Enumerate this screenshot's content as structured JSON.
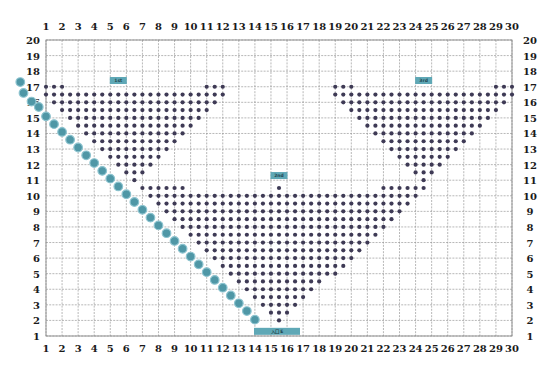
{
  "chart_data": {
    "type": "scatter",
    "title": "",
    "xlabel": "",
    "ylabel": "",
    "x_ticks": [
      1,
      2,
      3,
      4,
      5,
      6,
      7,
      8,
      9,
      10,
      11,
      12,
      13,
      14,
      15,
      16,
      17,
      18,
      19,
      20,
      21,
      22,
      23,
      24,
      25,
      26,
      27,
      28,
      29,
      30
    ],
    "y_ticks": [
      1,
      2,
      3,
      4,
      5,
      6,
      7,
      8,
      9,
      10,
      11,
      12,
      13,
      14,
      15,
      16,
      17,
      18,
      19,
      20
    ],
    "xlim": [
      1,
      30
    ],
    "ylim": [
      1,
      20
    ],
    "grid": true,
    "colors": {
      "dot": "#3e3a55",
      "seat": "#4f97a6",
      "label_box": "#5fa8b6"
    },
    "dot_step": 0.5,
    "regions": [
      {
        "name": "left-triangle",
        "rows": [
          {
            "row": 17,
            "spans": [
              [
                1,
                2
              ],
              [
                11,
                12
              ]
            ]
          },
          {
            "row": 16.5,
            "spans": [
              [
                1,
                12
              ]
            ]
          },
          {
            "row": 16,
            "spans": [
              [
                1.5,
                11.5
              ]
            ]
          },
          {
            "row": 15.5,
            "spans": [
              [
                2,
                11
              ]
            ]
          },
          {
            "row": 15,
            "spans": [
              [
                2.5,
                10.5
              ]
            ]
          },
          {
            "row": 14.5,
            "spans": [
              [
                3,
                10
              ]
            ]
          },
          {
            "row": 14,
            "spans": [
              [
                3.5,
                9.5
              ]
            ]
          },
          {
            "row": 13.5,
            "spans": [
              [
                4,
                9
              ]
            ]
          },
          {
            "row": 13,
            "spans": [
              [
                4.5,
                8.5
              ]
            ]
          },
          {
            "row": 12.5,
            "spans": [
              [
                5,
                8
              ]
            ]
          },
          {
            "row": 12,
            "spans": [
              [
                5.5,
                7.5
              ]
            ]
          },
          {
            "row": 11.5,
            "spans": [
              [
                6,
                7
              ]
            ]
          },
          {
            "row": 11,
            "spans": [
              [
                6.5,
                6.5
              ]
            ]
          }
        ]
      },
      {
        "name": "right-triangle",
        "rows": [
          {
            "row": 17,
            "spans": [
              [
                19,
                20
              ],
              [
                29,
                30
              ]
            ]
          },
          {
            "row": 16.5,
            "spans": [
              [
                19,
                30
              ]
            ]
          },
          {
            "row": 16,
            "spans": [
              [
                19.5,
                29.5
              ]
            ]
          },
          {
            "row": 15.5,
            "spans": [
              [
                20,
                29
              ]
            ]
          },
          {
            "row": 15,
            "spans": [
              [
                20.5,
                28.5
              ]
            ]
          },
          {
            "row": 14.5,
            "spans": [
              [
                21,
                28
              ]
            ]
          },
          {
            "row": 14,
            "spans": [
              [
                21.5,
                27.5
              ]
            ]
          },
          {
            "row": 13.5,
            "spans": [
              [
                22,
                27
              ]
            ]
          },
          {
            "row": 13,
            "spans": [
              [
                22.5,
                26.5
              ]
            ]
          },
          {
            "row": 12.5,
            "spans": [
              [
                23,
                26
              ]
            ]
          },
          {
            "row": 12,
            "spans": [
              [
                23.5,
                25.5
              ]
            ]
          },
          {
            "row": 11.5,
            "spans": [
              [
                24,
                25
              ]
            ]
          },
          {
            "row": 11,
            "spans": [
              [
                24.5,
                24.5
              ]
            ]
          }
        ]
      },
      {
        "name": "center-triangle",
        "rows": [
          {
            "row": 10.5,
            "spans": [
              [
                7,
                9.5
              ],
              [
                15.5,
                15.5
              ],
              [
                22,
                24.5
              ]
            ]
          },
          {
            "row": 10,
            "spans": [
              [
                7.5,
                24
              ]
            ]
          },
          {
            "row": 9.5,
            "spans": [
              [
                8,
                23.5
              ]
            ]
          },
          {
            "row": 9,
            "spans": [
              [
                8.5,
                23
              ]
            ]
          },
          {
            "row": 8.5,
            "spans": [
              [
                9,
                22.5
              ]
            ]
          },
          {
            "row": 8,
            "spans": [
              [
                9.5,
                22
              ]
            ]
          },
          {
            "row": 7.5,
            "spans": [
              [
                10,
                21.5
              ]
            ]
          },
          {
            "row": 7,
            "spans": [
              [
                10.5,
                21
              ]
            ]
          },
          {
            "row": 6.5,
            "spans": [
              [
                11,
                20.5
              ]
            ]
          },
          {
            "row": 6,
            "spans": [
              [
                11.5,
                20
              ]
            ]
          },
          {
            "row": 5.5,
            "spans": [
              [
                12,
                19.5
              ]
            ]
          },
          {
            "row": 5,
            "spans": [
              [
                12.5,
                19
              ]
            ]
          },
          {
            "row": 4.5,
            "spans": [
              [
                13,
                18
              ]
            ]
          },
          {
            "row": 4,
            "spans": [
              [
                13.5,
                17.5
              ]
            ]
          },
          {
            "row": 3.5,
            "spans": [
              [
                14,
                17
              ]
            ]
          },
          {
            "row": 3,
            "spans": [
              [
                14.5,
                16.5
              ]
            ]
          },
          {
            "row": 2.5,
            "spans": [
              [
                15,
                16
              ]
            ]
          },
          {
            "row": 2,
            "spans": [
              [
                15.5,
                15.5
              ]
            ]
          }
        ]
      }
    ],
    "seat_path": {
      "name": "diagonal-teal-markers",
      "points": [
        [
          -0.6,
          17.3
        ],
        [
          -0.4,
          16.6
        ],
        [
          0.1,
          16.05
        ],
        [
          0.55,
          15.7
        ],
        [
          1.0,
          15.1
        ],
        [
          1.5,
          14.6
        ],
        [
          2.0,
          14.1
        ],
        [
          2.5,
          13.6
        ],
        [
          3.0,
          13.1
        ],
        [
          3.5,
          12.6
        ],
        [
          4.0,
          12.1
        ],
        [
          4.5,
          11.6
        ],
        [
          5.0,
          11.1
        ],
        [
          5.5,
          10.6
        ],
        [
          6.0,
          10.1
        ],
        [
          6.5,
          9.6
        ],
        [
          7.0,
          9.1
        ],
        [
          7.5,
          8.6
        ],
        [
          8.0,
          8.1
        ],
        [
          8.5,
          7.6
        ],
        [
          9.0,
          7.1
        ],
        [
          9.5,
          6.6
        ],
        [
          10.0,
          6.1
        ],
        [
          10.5,
          5.6
        ],
        [
          11.0,
          5.1
        ],
        [
          11.5,
          4.6
        ],
        [
          12.0,
          4.1
        ],
        [
          12.5,
          3.6
        ],
        [
          13.0,
          3.1
        ],
        [
          13.5,
          2.6
        ],
        [
          14.0,
          2.05
        ]
      ]
    },
    "annotations": [
      {
        "text": "1st",
        "col": 5.5,
        "row": 17.4
      },
      {
        "text": "3rd",
        "col": 24.5,
        "row": 17.4
      },
      {
        "text": "2nd",
        "col": 15.5,
        "row": 11.3
      },
      {
        "text": "入口 E",
        "col": 15.5,
        "row": 1.3
      }
    ]
  }
}
